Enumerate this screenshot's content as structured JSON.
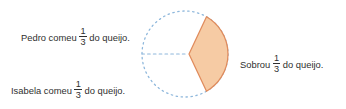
{
  "canvas": {
    "width": 346,
    "height": 109,
    "background": "#ffffff"
  },
  "colors": {
    "text": "#2f2f2f",
    "circle_dashed_stroke": "#8FB8DC",
    "sector_fill": "#F6CBA4",
    "sector_stroke": "#E08B5C"
  },
  "labels": {
    "pedro": {
      "before": "Pedro comeu",
      "numerator": "1",
      "denominator": "3",
      "after": "do queijo."
    },
    "isabela": {
      "before": "Isabela comeu",
      "numerator": "1",
      "denominator": "3",
      "after": "do queijo."
    },
    "sobrou": {
      "before": "Sobrou",
      "numerator": "1",
      "denominator": "3",
      "after": "do queijo."
    }
  },
  "diagram": {
    "type": "pie",
    "shape": "circle-divided-in-thirds",
    "circle": {
      "center_x": 185,
      "center_y": 54,
      "radius": 43,
      "stroke_style": "dashed"
    },
    "radius_line": {
      "angle_degrees": 180,
      "stroke_style": "dashed"
    },
    "sector": {
      "fraction": "1/3",
      "sweep_degrees": 120,
      "start_angle_degrees": -60,
      "end_angle_degrees": 60,
      "exploded": true,
      "explode_offset_x": 4
    }
  },
  "chart_data": {
    "type": "pie",
    "title": "",
    "categories": [
      "Pedro comeu",
      "Isabela comeu",
      "Sobrou"
    ],
    "values": [
      0.3333,
      0.3333,
      0.3333
    ],
    "value_labels": [
      "1/3",
      "1/3",
      "1/3"
    ],
    "total": 1,
    "units": "queijo",
    "highlighted_slice": "Sobrou",
    "legend": "annotations",
    "grid": false
  }
}
